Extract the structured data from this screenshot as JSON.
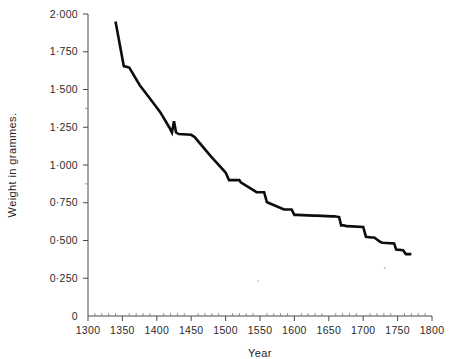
{
  "chart_data": {
    "type": "line",
    "title": "",
    "xlabel": "Year",
    "ylabel": "Weight in grammes.",
    "xlim": [
      1300,
      1800
    ],
    "ylim": [
      0,
      2.0
    ],
    "grid": false,
    "legend": "none",
    "x_ticks": [
      1300,
      1350,
      1400,
      1450,
      1500,
      1550,
      1600,
      1650,
      1700,
      1750,
      1800
    ],
    "x_tick_labels": [
      "1300",
      "1350",
      "1400",
      "1450",
      "1500",
      "1550",
      "1600",
      "1650",
      "1700",
      "1750",
      "1800"
    ],
    "y_ticks": [
      0,
      0.25,
      0.5,
      0.75,
      1.0,
      1.25,
      1.5,
      1.75,
      2.0
    ],
    "y_tick_labels": [
      "0",
      "0·250",
      "0·500",
      "0·750",
      "1·000",
      "1·250",
      "1·500",
      "1·750",
      "2·000"
    ],
    "series": [
      {
        "name": "Weight in grammes",
        "color": "#0d0d0d",
        "x": [
          1340,
          1352,
          1360,
          1375,
          1390,
          1405,
          1418,
          1422,
          1425,
          1428,
          1432,
          1450,
          1455,
          1478,
          1500,
          1505,
          1512,
          1520,
          1522,
          1545,
          1548,
          1556,
          1560,
          1562,
          1585,
          1588,
          1596,
          1600,
          1603,
          1628,
          1632,
          1655,
          1658,
          1665,
          1668,
          1672,
          1676,
          1700,
          1704,
          1712,
          1716,
          1725,
          1728,
          1745,
          1748,
          1758,
          1762,
          1770
        ],
        "y": [
          1.95,
          1.655,
          1.645,
          1.53,
          1.44,
          1.35,
          1.25,
          1.215,
          1.29,
          1.215,
          1.205,
          1.2,
          1.185,
          1.06,
          0.95,
          0.9,
          0.9,
          0.9,
          0.885,
          0.82,
          0.82,
          0.82,
          0.755,
          0.75,
          0.705,
          0.705,
          0.705,
          0.67,
          0.67,
          0.665,
          0.665,
          0.66,
          0.66,
          0.655,
          0.6,
          0.6,
          0.595,
          0.59,
          0.525,
          0.52,
          0.52,
          0.49,
          0.485,
          0.48,
          0.44,
          0.435,
          0.41,
          0.41
        ],
        "start_year": 1340,
        "start_value": 1.95,
        "end_year": 1770,
        "end_value": 0.41,
        "peak_anomaly_year": 1425,
        "peak_anomaly_value": 1.29
      }
    ]
  },
  "axes": {
    "x_axis_name": "Year",
    "y_axis_name": "Weight in grammes."
  }
}
